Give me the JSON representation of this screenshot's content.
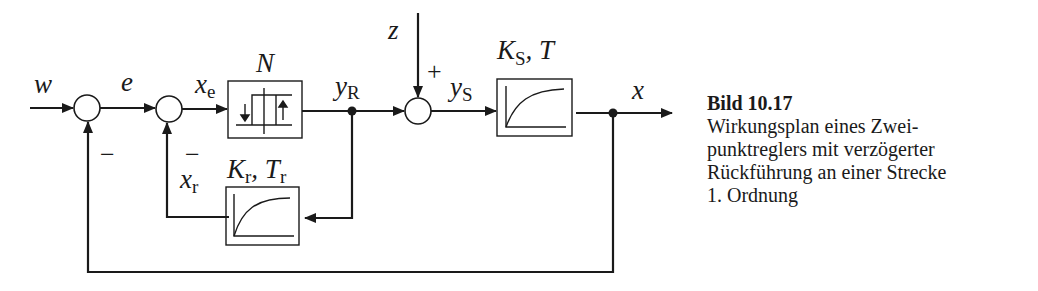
{
  "diagram": {
    "type": "block-diagram",
    "signals": {
      "w": "w",
      "e": "e",
      "x_e": {
        "base": "x",
        "sub": "e"
      },
      "y_R": {
        "base": "y",
        "sub": "R"
      },
      "z": "z",
      "y_S": {
        "base": "y",
        "sub": "S"
      },
      "x": "x",
      "x_r": {
        "base": "x",
        "sub": "r"
      }
    },
    "blocks": {
      "nonlinear": {
        "label": "N",
        "icon": "hysteresis-relay-icon"
      },
      "plant": {
        "label_base": "K",
        "label_sub": "S",
        "label_rest": ", T",
        "icon": "first-order-step-response-icon"
      },
      "feedback": {
        "label_k": "K",
        "label_k_sub": "r",
        "label_sep": ", ",
        "label_t": "T",
        "label_t_sub": "r",
        "icon": "first-order-step-response-icon"
      }
    },
    "signs": {
      "outer_feedback": "−",
      "inner_feedback": "−",
      "disturbance": "+"
    }
  },
  "caption": {
    "title": "Bild 10.17",
    "lines": [
      "Wirkungsplan eines Zwei-",
      "punktreglers mit verzögerter",
      "Rückführung an einer Strecke",
      "1. Ordnung"
    ]
  }
}
